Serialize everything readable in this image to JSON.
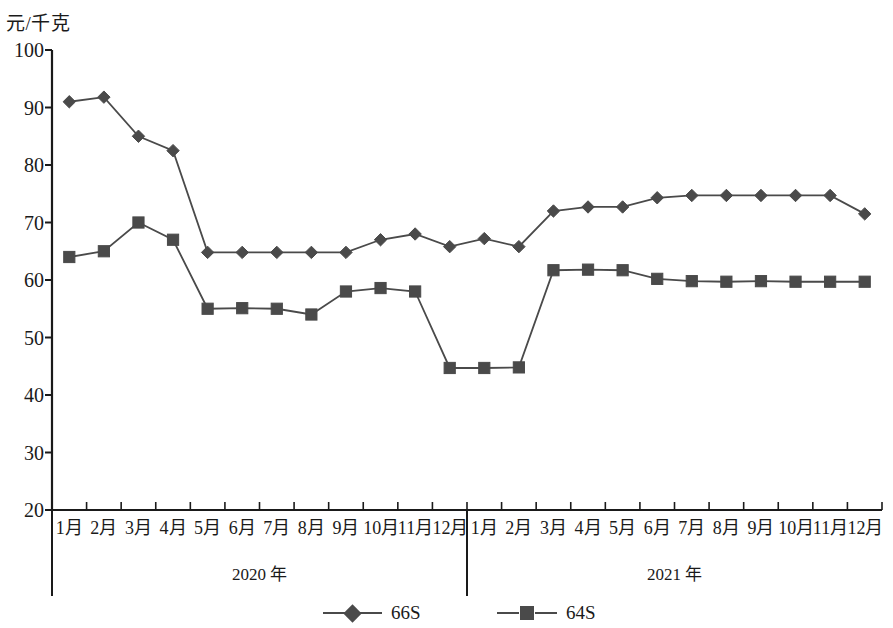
{
  "axes": {
    "y_unit_label": "元/千克",
    "y_ticks": [
      "100",
      "90",
      "80",
      "70",
      "60",
      "50",
      "40",
      "30",
      "20"
    ],
    "x_labels": [
      "1月",
      "2月",
      "3月",
      "4月",
      "5月",
      "6月",
      "7月",
      "8月",
      "9月",
      "10月",
      "11月",
      "12月",
      "1月",
      "2月",
      "3月",
      "4月",
      "5月",
      "6月",
      "7月",
      "8月",
      "9月",
      "10月",
      "11月",
      "12月"
    ],
    "year_groups": [
      {
        "label": "2020 年"
      },
      {
        "label": "2021 年"
      }
    ]
  },
  "legend": {
    "series_1_label": "66S",
    "series_2_label": "64S"
  },
  "colors": {
    "series": "#4a4a4a",
    "axis": "#1a1a1a"
  },
  "chart_data": {
    "type": "line",
    "title": "",
    "xlabel": "",
    "ylabel": "元/千克",
    "ylim": [
      20,
      100
    ],
    "ytick_step": 10,
    "grid": false,
    "legend_position": "bottom",
    "categories": [
      "2020-1月",
      "2020-2月",
      "2020-3月",
      "2020-4月",
      "2020-5月",
      "2020-6月",
      "2020-7月",
      "2020-8月",
      "2020-9月",
      "2020-10月",
      "2020-11月",
      "2020-12月",
      "2021-1月",
      "2021-2月",
      "2021-3月",
      "2021-4月",
      "2021-5月",
      "2021-6月",
      "2021-7月",
      "2021-8月",
      "2021-9月",
      "2021-10月",
      "2021-11月",
      "2021-12月"
    ],
    "series": [
      {
        "name": "66S",
        "marker": "diamond",
        "values": [
          91.0,
          91.8,
          85.0,
          82.5,
          64.8,
          64.8,
          64.8,
          64.8,
          64.8,
          67.0,
          68.0,
          65.8,
          67.2,
          65.8,
          72.0,
          72.7,
          72.7,
          74.3,
          74.7,
          74.7,
          74.7,
          74.7,
          74.7,
          71.5
        ]
      },
      {
        "name": "64S",
        "marker": "square",
        "values": [
          64.0,
          65.0,
          70.0,
          67.0,
          55.0,
          55.1,
          55.0,
          54.0,
          58.0,
          58.6,
          58.0,
          44.7,
          44.7,
          44.8,
          61.7,
          61.8,
          61.7,
          60.2,
          59.8,
          59.7,
          59.8,
          59.7,
          59.7,
          59.7
        ]
      }
    ]
  }
}
